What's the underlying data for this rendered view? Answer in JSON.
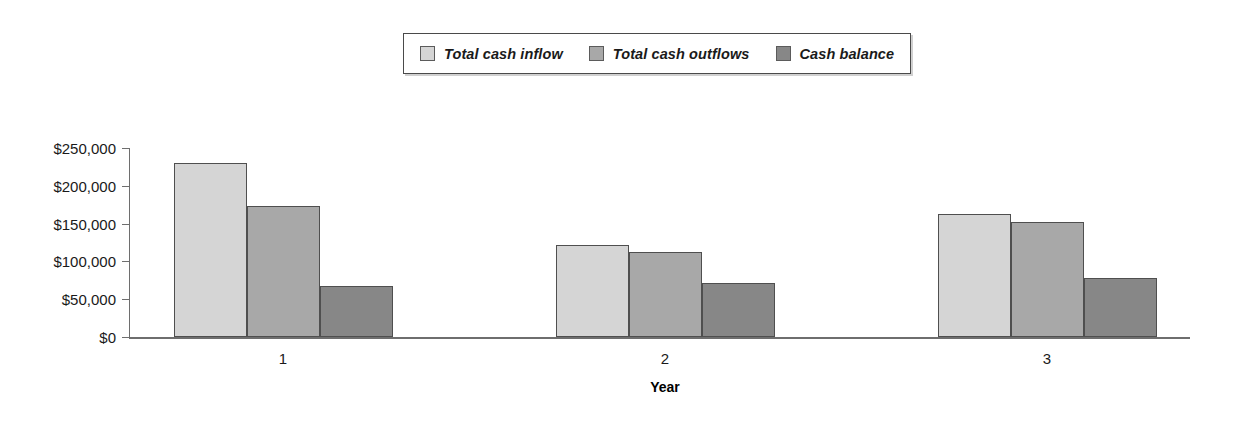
{
  "chart_data": {
    "type": "bar",
    "title": "",
    "subtitle": "",
    "xlabel": "Year",
    "ylabel": "",
    "categories": [
      "1",
      "2",
      "3"
    ],
    "series": [
      {
        "name": "Total cash inflow",
        "color": "#d5d5d5",
        "values": [
          230000,
          122000,
          163000
        ]
      },
      {
        "name": "Total cash outflows",
        "color": "#a8a8a8",
        "values": [
          173000,
          112000,
          152000
        ]
      },
      {
        "name": "Cash balance",
        "color": "#878787",
        "values": [
          67000,
          71000,
          78000
        ]
      }
    ],
    "ylim": [
      0,
      250000
    ],
    "yticks": [
      0,
      50000,
      100000,
      150000,
      200000,
      250000
    ],
    "ytick_labels": [
      "$0",
      "$50,000",
      "$100,000",
      "$150,000",
      "$200,000",
      "$250,000"
    ],
    "grid": false,
    "legend_position": "top-center",
    "legend_items": [
      "Total cash inflow",
      "Total cash outflows",
      "Cash balance"
    ]
  }
}
